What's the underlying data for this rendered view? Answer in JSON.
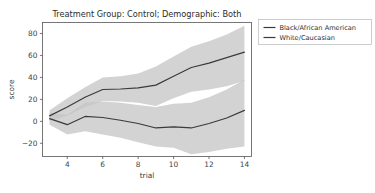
{
  "chart_data": {
    "type": "line",
    "title": "Treatment Group: Control; Demographic: Both",
    "xlabel": "trial",
    "ylabel": "score",
    "xlim": [
      2.6,
      14.4
    ],
    "ylim": [
      -32,
      90
    ],
    "xticks": [
      4,
      6,
      8,
      10,
      12,
      14
    ],
    "yticks": [
      -20,
      0,
      20,
      40,
      60,
      80
    ],
    "xtick_labels": [
      "4",
      "6",
      "8",
      "10",
      "12",
      "14"
    ],
    "ytick_labels": [
      "−20",
      "0",
      "20",
      "40",
      "60",
      "80"
    ],
    "grid": false,
    "legend_position": "outside-right-top",
    "x": [
      3,
      4,
      5,
      6,
      7,
      8,
      9,
      10,
      11,
      12,
      13,
      14
    ],
    "series": [
      {
        "name": "Black/African American",
        "color": "#3a3a3a",
        "band_color": "#c4c4c4",
        "band_opacity": 0.75,
        "values": [
          5,
          13,
          22,
          29,
          29.5,
          30.5,
          33,
          41,
          49,
          53,
          58,
          63
        ],
        "band_lower": [
          0,
          5,
          13,
          18.5,
          18,
          17,
          14,
          21,
          27,
          29,
          32,
          37
        ],
        "band_upper": [
          10,
          21,
          31,
          40,
          41,
          43.5,
          50,
          59,
          68,
          73,
          79,
          87
        ]
      },
      {
        "name": "White/Caucasian",
        "color": "#3a3a3a",
        "band_color": "#c4c4c4",
        "band_opacity": 0.75,
        "values": [
          2.5,
          -3,
          4.5,
          3.5,
          1,
          -2,
          -6,
          -5,
          -6,
          -2,
          3,
          10
        ],
        "band_lower": [
          -3,
          -12,
          -9,
          -12,
          -15,
          -19,
          -23,
          -24,
          -30,
          -28,
          -25,
          -23
        ],
        "band_upper": [
          8,
          6,
          17,
          18,
          17,
          15,
          13,
          16,
          17,
          22,
          29,
          38
        ]
      }
    ]
  },
  "legend": {
    "entries": [
      {
        "label": "Black/African American"
      },
      {
        "label": "White/Caucasian"
      }
    ]
  },
  "colors": {
    "background": "#ffffff",
    "axis": "#555555",
    "line": "#3a3a3a",
    "band": "#c4c4c4"
  }
}
